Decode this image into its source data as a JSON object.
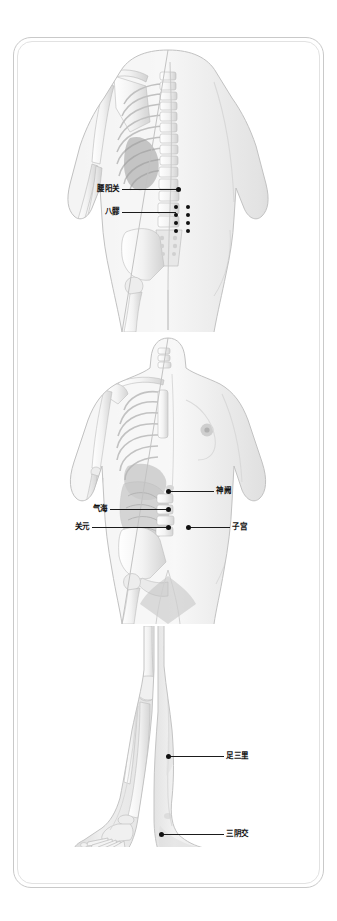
{
  "document": {
    "type": "acupuncture-point-chart",
    "language": "zh-CN",
    "background_color": "#ffffff",
    "frame_color": "#c9c9c9",
    "label_color": "#101010",
    "point_color": "#111111"
  },
  "panels": [
    {
      "id": "panel-back",
      "name": "back-view",
      "view": "posterior",
      "description_alt": "Posterior view of female body, left half skeleton with spine and ribs, right half skin surface",
      "labels": [
        {
          "text": "腰阳关",
          "side": "left"
        },
        {
          "text": "八髎",
          "side": "left"
        }
      ]
    },
    {
      "id": "panel-front",
      "name": "front-view",
      "view": "anterior",
      "description_alt": "Anterior view of female body, left half skeleton and internal organs, right half skin surface",
      "labels": [
        {
          "text": "神阙",
          "side": "right"
        },
        {
          "text": "气海",
          "side": "left"
        },
        {
          "text": "关元",
          "side": "left"
        },
        {
          "text": "子宫",
          "side": "right"
        }
      ]
    },
    {
      "id": "panel-legs",
      "name": "legs-view",
      "view": "anterior-lower-limb",
      "description_alt": "Anterior view of lower legs, left leg skeleton of tibia fibula and foot, right leg skin surface",
      "labels": [
        {
          "text": "足三里",
          "side": "right"
        },
        {
          "text": "三阴交",
          "side": "right"
        }
      ]
    }
  ],
  "acupoints": {
    "yaoyangguan": {
      "label": "腰阳关"
    },
    "baliao": {
      "label": "八髎",
      "dot_count": 8,
      "rows": 4,
      "columns": 2
    },
    "shenque": {
      "label": "神阙"
    },
    "qihai": {
      "label": "气海"
    },
    "guanyuan": {
      "label": "关元"
    },
    "zigong": {
      "label": "子宫"
    },
    "zusanli": {
      "label": "足三里"
    },
    "sanyinjiao": {
      "label": "三阴交"
    }
  }
}
